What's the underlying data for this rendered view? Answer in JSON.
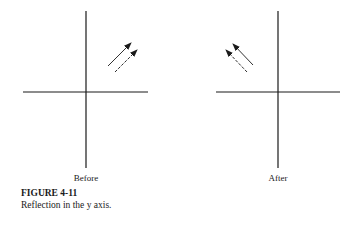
{
  "panels": [
    {
      "label": "Before"
    },
    {
      "label": "After"
    }
  ],
  "figure": {
    "number": "FIGURE 4-11",
    "caption": "Reflection in the y axis."
  },
  "colors": {
    "ink": "#1a1a1a",
    "background": "#ffffff"
  }
}
